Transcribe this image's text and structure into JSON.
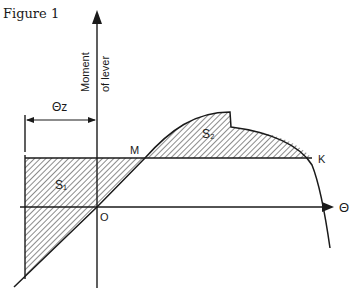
{
  "figure": {
    "title": "Figure 1",
    "y_axis_label_line1": "Moment",
    "y_axis_label_line2": "of lever",
    "x_axis_label": "Θ",
    "origin_label": "O",
    "point_m_label": "M",
    "point_k_label": "K",
    "dimension_label": "Θz",
    "area1_label": "S₁",
    "area2_label": "S₂",
    "colors": {
      "ink": "#1a1a1a",
      "background": "#ffffff"
    }
  }
}
